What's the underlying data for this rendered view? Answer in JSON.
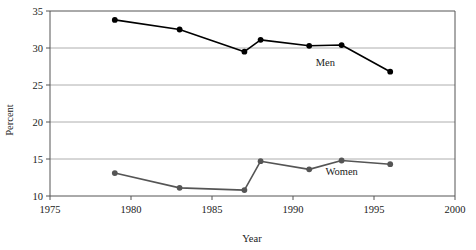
{
  "chart_data": {
    "type": "line",
    "title": "",
    "xlabel": "Year",
    "ylabel": "Percent",
    "xlim": [
      1975,
      2000
    ],
    "ylim": [
      10,
      35
    ],
    "xticks": [
      1975,
      1980,
      1985,
      1990,
      1995,
      2000
    ],
    "xtick_labels": [
      "1975",
      "1980",
      "1985",
      "1990",
      "1995",
      "2000"
    ],
    "yticks": [
      10,
      15,
      20,
      25,
      30,
      35
    ],
    "ytick_labels": [
      "10",
      "15",
      "20",
      "25",
      "30",
      "35"
    ],
    "grid": "horizontal",
    "legend_position": "inline-annotations",
    "series": [
      {
        "name": "Men",
        "color": "#000000",
        "marker": "filled-circle",
        "label_x": 1992,
        "label_y": 27.6,
        "x": [
          1979,
          1983,
          1987,
          1988,
          1991,
          1993,
          1996
        ],
        "values": [
          33.8,
          32.5,
          29.5,
          31.1,
          30.3,
          30.4,
          26.8
        ]
      },
      {
        "name": "Women",
        "color": "#555555",
        "marker": "filled-circle",
        "label_x": 1993,
        "label_y": 12.8,
        "x": [
          1979,
          1983,
          1987,
          1988,
          1991,
          1993,
          1996
        ],
        "values": [
          13.1,
          11.1,
          10.8,
          14.7,
          13.6,
          14.8,
          14.3
        ]
      }
    ]
  },
  "axes": {
    "x_title": "Year",
    "y_title": "Percent"
  },
  "colors": {
    "men_line": "#000000",
    "women_line": "#555555",
    "grid": "#9a9a9a",
    "axis": "#555555",
    "background": "#ffffff"
  }
}
